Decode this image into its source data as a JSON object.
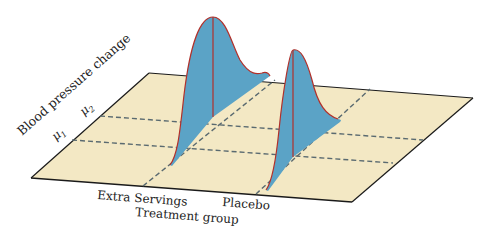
{
  "figure": {
    "type": "3D distribution diagram",
    "axes": {
      "y_label": "Blood pressure change",
      "x_label": "Treatment group",
      "y_ticks": [
        "μ1",
        "μ2"
      ],
      "x_categories": [
        "Extra Servings",
        "Placebo"
      ]
    },
    "distributions": [
      {
        "group": "Extra Servings",
        "mean": "μ2",
        "shape": "normal"
      },
      {
        "group": "Placebo",
        "mean": "μ1",
        "shape": "normal"
      }
    ],
    "colors": {
      "plane_fill": "#f3e8c4",
      "plane_edge": "#1a1a1a",
      "curve_fill": "#5ba3c6",
      "curve_edge": "#b2302a",
      "dashed_line": "#5a6a70",
      "text": "#222222"
    }
  },
  "labels": {
    "y_axis": "Blood pressure change",
    "x_axis": "Treatment group",
    "mu1_symbol": "μ",
    "mu1_sub": "1",
    "mu2_symbol": "μ",
    "mu2_sub": "2",
    "group1": "Extra Servings",
    "group2": "Placebo"
  }
}
